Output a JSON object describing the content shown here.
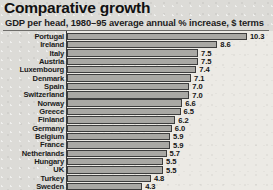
{
  "header": {
    "title": "Comparative growth",
    "subtitle": "GDP per head, 1980–95 average annual % increase, $ terms"
  },
  "chart_data": {
    "type": "bar",
    "orientation": "horizontal",
    "title": "Comparative growth",
    "subtitle": "GDP per head, 1980–95 average annual % increase, $ terms",
    "xlabel": "",
    "ylabel": "",
    "xlim": [
      0,
      10.3
    ],
    "grid": false,
    "legend": null,
    "data_labels": true,
    "bar_color": "#a9a8a4",
    "bar_border_color": "#3d3d3d",
    "categories": [
      "Portugal",
      "Ireland",
      "Italy",
      "Austria",
      "Luxembourg",
      "Denmark",
      "Spain",
      "Switzerland",
      "Norway",
      "Greece",
      "Finland",
      "Germany",
      "Belgium",
      "France",
      "Netherlands",
      "Hungary",
      "UK",
      "Turkey",
      "Sweden"
    ],
    "values": [
      10.3,
      8.6,
      7.5,
      7.5,
      7.4,
      7.1,
      7.0,
      7.0,
      6.6,
      6.5,
      6.2,
      6.0,
      5.9,
      5.9,
      5.7,
      5.5,
      5.5,
      4.8,
      4.3
    ],
    "value_labels": [
      "10.3",
      "8.6",
      "7.5",
      "7.5",
      "7.4",
      "7.1",
      "7.0",
      "7.0",
      "6.6",
      "6.5",
      "6.2",
      "6.0",
      "5.9",
      "5.9",
      "5.7",
      "5.5",
      "5.5",
      "4.8",
      "4.3"
    ]
  }
}
